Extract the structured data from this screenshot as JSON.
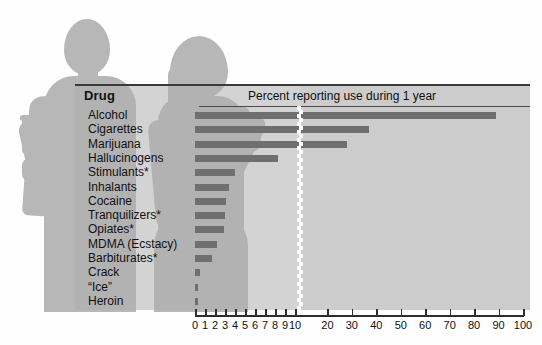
{
  "column_header": "Drug",
  "chart_title": "Percent reporting use during 1 year",
  "silhouettes": [
    "man-with-cup",
    "woman-pointing"
  ],
  "colors": {
    "bar": "#6f6f6f",
    "panel_left": "#afafaf",
    "panel_right": "#c6c6c6",
    "silhouette": "#b7b7b7",
    "axis": "#2e2e2e",
    "text": "#111111",
    "break": "#ffffff"
  },
  "chart_data": {
    "type": "bar",
    "orientation": "horizontal",
    "title": "Percent reporting use during 1 year",
    "xlabel": "",
    "ylabel": "Drug",
    "categories": [
      "Alcohol",
      "Cigarettes",
      "Marijuana",
      "Hallucinogens",
      "Stimulants*",
      "Inhalants",
      "Cocaine",
      "Tranquilizers*",
      "Opiates*",
      "MDMA (Ecstacy)",
      "Barbiturates*",
      "Crack",
      "“Ice”",
      "Heroin"
    ],
    "values": [
      89,
      37,
      28,
      8.3,
      4.0,
      3.4,
      3.1,
      3.0,
      2.9,
      2.2,
      1.7,
      0.5,
      0.3,
      0.2
    ],
    "xlim": [
      0,
      100
    ],
    "broken_axis": true,
    "axis_segments": [
      {
        "range": [
          0,
          10
        ],
        "tick_step": 1
      },
      {
        "range": [
          10,
          100
        ],
        "tick_step": 10
      }
    ],
    "tick_labels": [
      "0",
      "1",
      "2",
      "3",
      "4",
      "5",
      "6",
      "7",
      "8",
      "9",
      "10",
      "20",
      "30",
      "40",
      "50",
      "60",
      "70",
      "80",
      "90",
      "100"
    ],
    "grid": false,
    "legend": "none"
  }
}
